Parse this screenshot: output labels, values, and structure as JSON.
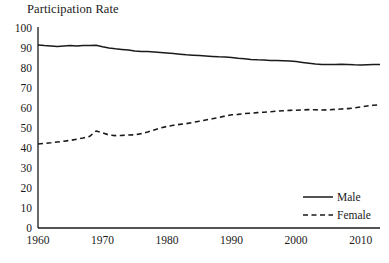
{
  "chart_data": {
    "type": "line",
    "title": "Participation Rate",
    "xlabel": "",
    "ylabel": "",
    "xlim": [
      1960,
      2013
    ],
    "ylim": [
      0,
      100
    ],
    "grid": false,
    "legend_position": "bottom-right",
    "y_ticks": [
      100,
      90,
      80,
      70,
      60,
      50,
      40,
      30,
      20,
      10,
      0
    ],
    "x_ticks": [
      1960,
      1970,
      1980,
      1990,
      2000,
      2010
    ],
    "x": [
      1960,
      1961,
      1962,
      1963,
      1964,
      1965,
      1966,
      1967,
      1968,
      1969,
      1970,
      1971,
      1972,
      1973,
      1974,
      1975,
      1976,
      1977,
      1978,
      1979,
      1980,
      1981,
      1982,
      1983,
      1984,
      1985,
      1986,
      1987,
      1988,
      1989,
      1990,
      1991,
      1992,
      1993,
      1994,
      1995,
      1996,
      1997,
      1998,
      1999,
      2000,
      2001,
      2002,
      2003,
      2004,
      2005,
      2006,
      2007,
      2008,
      2009,
      2010,
      2011,
      2012,
      2013
    ],
    "series": [
      {
        "name": "Male",
        "style": "solid",
        "color": "#1a1a1a",
        "values": [
          91.5,
          91.2,
          91.0,
          90.8,
          91.0,
          91.2,
          91.0,
          91.3,
          91.2,
          91.4,
          90.6,
          90.0,
          89.6,
          89.3,
          89.0,
          88.5,
          88.3,
          88.2,
          88.0,
          87.8,
          87.5,
          87.2,
          86.9,
          86.6,
          86.4,
          86.2,
          86.0,
          85.8,
          85.6,
          85.5,
          85.3,
          84.9,
          84.6,
          84.3,
          84.1,
          84.0,
          83.8,
          83.7,
          83.6,
          83.5,
          83.2,
          82.8,
          82.4,
          82.0,
          81.8,
          81.7,
          81.8,
          81.9,
          81.8,
          81.6,
          81.5,
          81.6,
          81.7,
          81.8
        ]
      },
      {
        "name": "Female",
        "style": "dashed",
        "color": "#1a1a1a",
        "values": [
          42.0,
          42.3,
          42.6,
          43.0,
          43.4,
          43.8,
          44.4,
          45.0,
          45.8,
          48.5,
          47.6,
          46.5,
          46.2,
          46.3,
          46.5,
          46.6,
          47.2,
          48.0,
          49.0,
          50.0,
          50.8,
          51.4,
          51.8,
          52.2,
          52.8,
          53.4,
          54.0,
          54.6,
          55.2,
          56.0,
          56.6,
          56.8,
          57.2,
          57.4,
          57.7,
          57.9,
          58.1,
          58.4,
          58.6,
          58.8,
          58.9,
          59.0,
          59.2,
          59.1,
          59.0,
          59.1,
          59.3,
          59.5,
          59.7,
          60.0,
          60.5,
          61.0,
          61.4,
          61.6
        ]
      }
    ],
    "legend": [
      {
        "label": "Male",
        "style": "solid"
      },
      {
        "label": "Female",
        "style": "dashed"
      }
    ]
  }
}
